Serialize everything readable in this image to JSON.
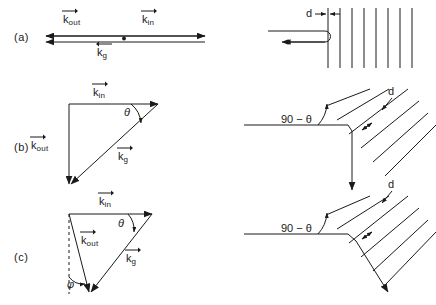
{
  "figure": {
    "width": 436,
    "height": 305,
    "background": "#ffffff",
    "ink": "#1a1a1a"
  },
  "panels": [
    {
      "tag": "(a)",
      "tag_pos": {
        "x": 14,
        "y": 38
      },
      "left": {
        "type": "collinear-vector-diagram",
        "labels": [
          {
            "name": "k-out",
            "symbol": "k",
            "subscript": "out",
            "arrow": "right",
            "x": 63,
            "y": 19
          },
          {
            "name": "k-in",
            "symbol": "k",
            "subscript": "in",
            "arrow": "right",
            "x": 142,
            "y": 19
          },
          {
            "name": "k-g",
            "symbol": "k",
            "subscript": "g",
            "arrow": "left",
            "x": 97,
            "y": 52
          }
        ]
      },
      "right": {
        "type": "vertical-grating",
        "spacing_label": "d",
        "spacing_label_pos": {
          "x": 308,
          "y": 12
        },
        "line_count": 8
      }
    },
    {
      "tag": "(b)",
      "tag_pos": {
        "x": 14,
        "y": 148
      },
      "left": {
        "type": "right-triangle-vector-diagram",
        "labels": [
          {
            "name": "k-in",
            "symbol": "k",
            "subscript": "in",
            "arrow": "right",
            "x": 93,
            "y": 92
          },
          {
            "name": "k-out",
            "symbol": "k",
            "subscript": "out",
            "arrow": "right",
            "x": 41,
            "y": 145
          },
          {
            "name": "k-g",
            "symbol": "k",
            "subscript": "g",
            "arrow": "right",
            "x": 122,
            "y": 156
          },
          {
            "name": "theta",
            "symbol": "θ",
            "x": 128,
            "y": 112
          }
        ]
      },
      "right": {
        "type": "tilted-grating",
        "angle_label": "90 − θ",
        "angle_label_pos": {
          "x": 289,
          "y": 120
        },
        "spacing_label": "d",
        "spacing_label_pos": {
          "x": 389,
          "y": 92
        },
        "line_count": 6
      }
    },
    {
      "tag": "(c)",
      "tag_pos": {
        "x": 14,
        "y": 258
      },
      "left": {
        "type": "oblique-triangle-vector-diagram",
        "labels": [
          {
            "name": "k-in",
            "symbol": "k",
            "subscript": "in",
            "arrow": "right",
            "x": 99,
            "y": 201
          },
          {
            "name": "k-out",
            "symbol": "k",
            "subscript": "out",
            "arrow": "right",
            "x": 85,
            "y": 240
          },
          {
            "name": "k-g",
            "symbol": "k",
            "subscript": "g",
            "arrow": "right",
            "x": 128,
            "y": 258
          },
          {
            "name": "theta",
            "symbol": "θ",
            "x": 122,
            "y": 223
          },
          {
            "name": "phi",
            "symbol": "φ",
            "x": 70,
            "y": 285
          }
        ]
      },
      "right": {
        "type": "tilted-grating",
        "angle_label": "90 − θ",
        "angle_label_pos": {
          "x": 289,
          "y": 229
        },
        "spacing_label": "d",
        "spacing_label_pos": {
          "x": 389,
          "y": 185
        },
        "line_count": 6
      }
    }
  ],
  "symbols": {
    "k": "k",
    "theta": "θ",
    "phi": "φ",
    "d": "d",
    "ninety_minus_theta_prefix": "90",
    "minus": "−"
  }
}
